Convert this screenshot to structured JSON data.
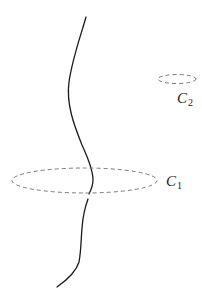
{
  "diagram": {
    "colors": {
      "curve": "#1a1a1a",
      "loop": "#7a7a7a",
      "background": "#ffffff"
    },
    "curve": {
      "name": "wire",
      "upper_path": "M86,17 C80,38 72,60 69,82 C66,104 74,125 82,145 C88,158 93,170 93,180 C93,186 91,190 89,194",
      "lower_path": "M88,199 C85,207 83,215 82,228 C81,240 81,252 79,262 C76,272 67,280 57,287"
    },
    "loops": [
      {
        "id": "C1",
        "label_main": "C",
        "label_sub": "1",
        "cx": 84.5,
        "cy": 180.5,
        "rx": 72.5,
        "ry": 12.5,
        "label_x": 166,
        "label_y": 186,
        "encloses_curve": true
      },
      {
        "id": "C2",
        "label_main": "C",
        "label_sub": "2",
        "cx": 177,
        "cy": 79,
        "rx": 19,
        "ry": 4.5,
        "label_x": 177,
        "label_y": 103,
        "encloses_curve": false
      }
    ]
  }
}
